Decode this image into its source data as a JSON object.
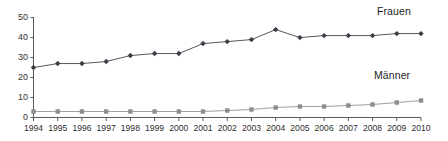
{
  "chart_data": {
    "type": "line",
    "title": "",
    "subtitle": "",
    "xlabel": "",
    "ylabel": "",
    "categories": [
      "1994",
      "1995",
      "1996",
      "1997",
      "1998",
      "1999",
      "2000",
      "2001",
      "2002",
      "2003",
      "2004",
      "2005",
      "2006",
      "2007",
      "2008",
      "2009",
      "2010"
    ],
    "xlim": [
      1994,
      2010
    ],
    "ylim": [
      0,
      50
    ],
    "yticks": [
      0,
      10,
      20,
      30,
      40,
      50
    ],
    "ytick_labels": [
      "0",
      "10",
      "20",
      "30",
      "40",
      "50"
    ],
    "grid": false,
    "legend_position": "inline-right-of-series",
    "series": [
      {
        "name": "Frauen",
        "marker": "diamond",
        "color": "#3c3c46",
        "line_color": "#58585f",
        "values": [
          25,
          27,
          27,
          28,
          31,
          32,
          32,
          37,
          38,
          39,
          44,
          40,
          41,
          41,
          41,
          42,
          42
        ]
      },
      {
        "name": "Männer",
        "marker": "square",
        "color": "#8c8c93",
        "line_color": "#a0a0a6",
        "values": [
          3,
          3,
          3,
          3,
          3,
          3,
          3,
          3,
          3.5,
          4,
          5,
          5.5,
          5.5,
          6,
          6.5,
          7.5,
          8.5
        ]
      }
    ],
    "annotations": [
      {
        "text": "Frauen",
        "x": 2008,
        "y": 49
      },
      {
        "text": "Männer",
        "x": 2008,
        "y": 16
      }
    ]
  },
  "axes": {
    "y_axis_name": "vertical-axis",
    "x_axis_name": "horizontal-axis"
  },
  "colors": {
    "background": "#ffffff",
    "axis": "#5a5a5a",
    "frauen": "#3c3c46",
    "maenner": "#8c8c93",
    "text": "#2e2e2e"
  }
}
